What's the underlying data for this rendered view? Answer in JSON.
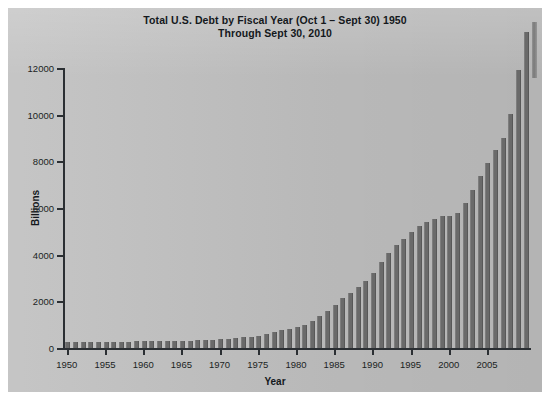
{
  "figure": {
    "title_line1": "Total U.S. Debt by Fiscal Year (Oct 1 – Sept 30) 1950",
    "title_line2": "Through Sept 30, 2010",
    "background_color": "#bfbfbf",
    "bar_color": "#6a6a6a",
    "axis_color": "#2b2f33"
  },
  "chart_data": {
    "type": "bar",
    "title": "Total U.S. Debt by Fiscal Year (Oct 1 – Sept 30) 1950 Through Sept 30, 2010",
    "xlabel": "Year",
    "ylabel": "Billions",
    "xlim": [
      1949.5,
      2010.5
    ],
    "ylim": [
      0,
      12000
    ],
    "yticks": [
      0,
      2000,
      4000,
      6000,
      8000,
      10000,
      12000
    ],
    "ytick_labels": [
      "0",
      "2000",
      "4000",
      "6000",
      "8000",
      "10000",
      "12000"
    ],
    "xticks": [
      1950,
      1955,
      1960,
      1965,
      1970,
      1975,
      1980,
      1985,
      1990,
      1995,
      2000,
      2005
    ],
    "xtick_labels": [
      "1950",
      "1955",
      "1960",
      "1965",
      "1970",
      "1975",
      "1980",
      "1985",
      "1990",
      "1995",
      "2000",
      "2005"
    ],
    "grid": false,
    "legend": false,
    "categories": [
      1950,
      1951,
      1952,
      1953,
      1954,
      1955,
      1956,
      1957,
      1958,
      1959,
      1960,
      1961,
      1962,
      1963,
      1964,
      1965,
      1966,
      1967,
      1968,
      1969,
      1970,
      1971,
      1972,
      1973,
      1974,
      1975,
      1976,
      1977,
      1978,
      1979,
      1980,
      1981,
      1982,
      1983,
      1984,
      1985,
      1986,
      1987,
      1988,
      1989,
      1990,
      1991,
      1992,
      1993,
      1994,
      1995,
      1996,
      1997,
      1998,
      1999,
      2000,
      2001,
      2002,
      2003,
      2004,
      2005,
      2006,
      2007,
      2008,
      2009,
      2010
    ],
    "values": [
      257,
      255,
      259,
      266,
      271,
      274,
      273,
      271,
      276,
      285,
      286,
      289,
      298,
      306,
      312,
      317,
      320,
      326,
      348,
      354,
      371,
      398,
      427,
      458,
      475,
      533,
      620,
      699,
      772,
      827,
      908,
      998,
      1142,
      1377,
      1572,
      1823,
      2125,
      2350,
      2602,
      2857,
      3233,
      3665,
      4065,
      4411,
      4693,
      4974,
      5225,
      5413,
      5526,
      5656,
      5674,
      5807,
      6228,
      6783,
      7379,
      7933,
      8507,
      9008,
      10025,
      11910,
      13562
    ],
    "units": "Billions of dollars"
  }
}
